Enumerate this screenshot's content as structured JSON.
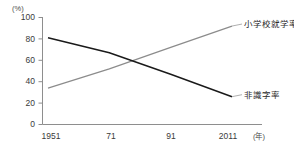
{
  "chart_data": {
    "type": "line",
    "title": "",
    "xlabel": "年",
    "ylabel": "%",
    "x_unit_label": "(年)",
    "y_unit_label": "(%)",
    "x": [
      1951,
      1971,
      1991,
      2011
    ],
    "categories": [
      "1951",
      "71",
      "91",
      "2011"
    ],
    "xtick_labels": [
      "1951",
      "71",
      "91",
      "2011"
    ],
    "ytick_labels": [
      "0",
      "20",
      "40",
      "60",
      "80",
      "100"
    ],
    "ytick_values": [
      0,
      20,
      40,
      60,
      80,
      100
    ],
    "xlim": [
      1951,
      2011
    ],
    "ylim": [
      0,
      100
    ],
    "grid": false,
    "legend_position": "inline-right",
    "series": [
      {
        "name": "小学校就学率",
        "label": "小学校就学率",
        "color": "#8c8c8c",
        "values": [
          34,
          52,
          72,
          92
        ],
        "x": [
          1951,
          1971,
          1991,
          2011
        ]
      },
      {
        "name": "非識字率",
        "label": "非識字率",
        "color": "#1a1a1a",
        "values": [
          81,
          67,
          47,
          26
        ],
        "x": [
          1951,
          1971,
          1991,
          2011
        ]
      }
    ],
    "annotations": [
      {
        "text": "小学校就学率",
        "series": "小学校就学率"
      },
      {
        "text": "非識字率",
        "series": "非識字率"
      }
    ]
  }
}
